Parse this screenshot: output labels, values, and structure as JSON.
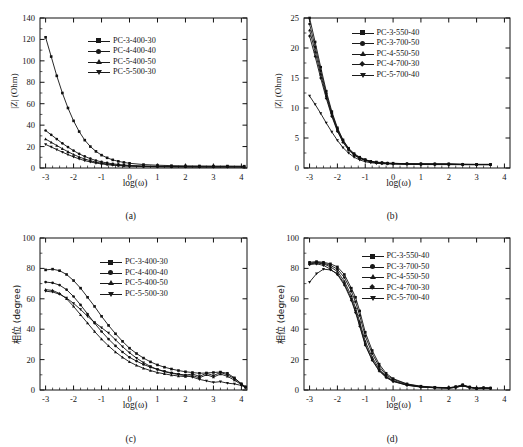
{
  "figure": {
    "panels": [
      {
        "id": "a",
        "caption": "(a)",
        "xlabel": "log(ω)",
        "ylabel": "|Z| (Ohm)"
      },
      {
        "id": "b",
        "caption": "(b)",
        "xlabel": "log(ω)",
        "ylabel": "|Z| (Ohm)"
      },
      {
        "id": "c",
        "caption": "(c)",
        "xlabel": "log(ω)",
        "ylabel": "相位 (degree)"
      },
      {
        "id": "d",
        "caption": "(d)",
        "xlabel": "log(ω)",
        "ylabel": "相位 (degree)"
      }
    ]
  },
  "chart_data": [
    {
      "type": "line",
      "panel": "a",
      "title": "",
      "xlabel": "log(ω)",
      "ylabel": "|Z| (Ohm)",
      "xlim": [
        -3.2,
        4.2
      ],
      "ylim": [
        0,
        140
      ],
      "xticks": [
        -3,
        -2,
        -1,
        0,
        1,
        2,
        3,
        4
      ],
      "yticks": [
        0,
        20,
        40,
        60,
        80,
        100,
        120,
        140
      ],
      "grid": false,
      "legend_position": "upper-center",
      "x": [
        -3.0,
        -2.8,
        -2.6,
        -2.4,
        -2.2,
        -2.0,
        -1.8,
        -1.6,
        -1.4,
        -1.2,
        -1.0,
        -0.8,
        -0.6,
        -0.4,
        -0.2,
        0.0,
        0.5,
        1.0,
        1.5,
        2.0,
        2.5,
        3.0,
        3.5,
        4.1
      ],
      "series": [
        {
          "name": "PC-3-400-30",
          "marker": "square",
          "values": [
            122.0,
            104.0,
            86.0,
            70.0,
            56.0,
            44.0,
            34.0,
            26.0,
            20.0,
            15.5,
            12.0,
            9.5,
            7.6,
            6.2,
            5.2,
            4.4,
            3.2,
            2.6,
            2.2,
            2.0,
            1.9,
            1.8,
            1.8,
            1.7
          ]
        },
        {
          "name": "PC-4-400-40",
          "marker": "circle",
          "values": [
            35.0,
            31.0,
            27.0,
            23.0,
            19.5,
            16.2,
            13.2,
            10.8,
            8.7,
            7.0,
            5.7,
            4.7,
            3.9,
            3.3,
            2.8,
            2.4,
            1.9,
            1.6,
            1.4,
            1.3,
            1.2,
            1.2,
            1.2,
            1.1
          ]
        },
        {
          "name": "PC-5-400-50",
          "marker": "triangle",
          "values": [
            27.0,
            24.0,
            21.0,
            18.0,
            15.2,
            12.6,
            10.3,
            8.4,
            6.8,
            5.5,
            4.5,
            3.7,
            3.1,
            2.6,
            2.2,
            1.9,
            1.5,
            1.3,
            1.2,
            1.1,
            1.1,
            1.0,
            1.0,
            1.0
          ]
        },
        {
          "name": "PC-5-500-30",
          "marker": "dtriangle",
          "values": [
            22.0,
            19.6,
            17.2,
            14.8,
            12.5,
            10.4,
            8.5,
            6.9,
            5.6,
            4.6,
            3.8,
            3.1,
            2.6,
            2.2,
            1.9,
            1.7,
            1.3,
            1.1,
            1.0,
            1.0,
            0.9,
            0.9,
            0.9,
            0.9
          ]
        }
      ]
    },
    {
      "type": "line",
      "panel": "b",
      "title": "",
      "xlabel": "log(ω)",
      "ylabel": "|Z| (Ohm)",
      "xlim": [
        -3.2,
        4.2
      ],
      "ylim": [
        0,
        25
      ],
      "xticks": [
        -3,
        -2,
        -1,
        0,
        1,
        2,
        3,
        4
      ],
      "yticks": [
        0,
        5,
        10,
        15,
        20,
        25
      ],
      "grid": false,
      "legend_position": "upper-center",
      "x": [
        -3.0,
        -2.8,
        -2.6,
        -2.4,
        -2.2,
        -2.0,
        -1.8,
        -1.6,
        -1.4,
        -1.2,
        -1.0,
        -0.8,
        -0.6,
        -0.4,
        -0.2,
        0.0,
        0.5,
        1.0,
        1.5,
        2.0,
        2.5,
        3.0,
        3.5
      ],
      "series": [
        {
          "name": "PC-3-550-40",
          "marker": "square",
          "values": [
            25.0,
            21.0,
            16.8,
            12.8,
            9.4,
            6.7,
            4.7,
            3.3,
            2.4,
            1.8,
            1.4,
            1.1,
            1.0,
            0.9,
            0.8,
            0.8,
            0.7,
            0.7,
            0.7,
            0.7,
            0.6,
            0.6,
            0.6
          ]
        },
        {
          "name": "PC-3-700-50",
          "marker": "circle",
          "values": [
            24.0,
            20.2,
            16.2,
            12.4,
            9.1,
            6.5,
            4.6,
            3.2,
            2.3,
            1.7,
            1.35,
            1.1,
            0.95,
            0.85,
            0.8,
            0.75,
            0.7,
            0.68,
            0.66,
            0.65,
            0.62,
            0.6,
            0.6
          ]
        },
        {
          "name": "PC-4-550-50",
          "marker": "triangle",
          "values": [
            23.0,
            19.4,
            15.6,
            12.0,
            8.8,
            6.3,
            4.4,
            3.1,
            2.2,
            1.65,
            1.3,
            1.05,
            0.9,
            0.82,
            0.77,
            0.73,
            0.68,
            0.65,
            0.63,
            0.62,
            0.6,
            0.58,
            0.58
          ]
        },
        {
          "name": "PC-4-700-30",
          "marker": "diamond",
          "values": [
            22.0,
            18.6,
            15.0,
            11.6,
            8.6,
            6.1,
            4.3,
            3.0,
            2.15,
            1.6,
            1.27,
            1.03,
            0.88,
            0.8,
            0.75,
            0.72,
            0.66,
            0.63,
            0.61,
            0.6,
            0.58,
            0.57,
            0.56
          ]
        },
        {
          "name": "PC-5-700-40",
          "marker": "dtriangle",
          "values": [
            12.0,
            10.6,
            9.1,
            7.5,
            6.0,
            4.6,
            3.4,
            2.5,
            1.8,
            1.35,
            1.05,
            0.88,
            0.78,
            0.72,
            0.68,
            0.65,
            0.6,
            0.58,
            0.57,
            0.56,
            0.55,
            0.54,
            0.54
          ]
        }
      ]
    },
    {
      "type": "line",
      "panel": "c",
      "title": "",
      "xlabel": "log(ω)",
      "ylabel": "相位 (degree)",
      "xlim": [
        -3.2,
        4.2
      ],
      "ylim": [
        0,
        100
      ],
      "xticks": [
        -3,
        -2,
        -1,
        0,
        1,
        2,
        3,
        4
      ],
      "yticks": [
        0,
        20,
        40,
        60,
        80,
        100
      ],
      "grid": false,
      "legend_position": "upper-center",
      "x": [
        -3.0,
        -2.75,
        -2.5,
        -2.25,
        -2.0,
        -1.75,
        -1.5,
        -1.25,
        -1.0,
        -0.75,
        -0.5,
        -0.25,
        0.0,
        0.25,
        0.5,
        0.75,
        1.0,
        1.25,
        1.5,
        1.75,
        2.0,
        2.25,
        2.5,
        2.75,
        3.0,
        3.25,
        3.5,
        3.75,
        4.0,
        4.15
      ],
      "series": [
        {
          "name": "PC-3-400-30",
          "marker": "square",
          "values": [
            79.0,
            79.5,
            78.5,
            76.0,
            72.0,
            67.0,
            61.0,
            55.0,
            48.5,
            42.5,
            37.0,
            32.0,
            27.5,
            24.0,
            21.0,
            18.5,
            16.5,
            15.0,
            13.8,
            12.8,
            12.0,
            11.5,
            11.0,
            11.2,
            11.5,
            11.8,
            11.0,
            8.0,
            4.0,
            2.0
          ]
        },
        {
          "name": "PC-4-400-40",
          "marker": "circle",
          "values": [
            71.0,
            70.5,
            69.0,
            66.0,
            61.5,
            56.0,
            50.0,
            44.0,
            38.5,
            33.5,
            29.0,
            25.0,
            21.5,
            19.0,
            16.8,
            15.0,
            13.5,
            12.3,
            11.3,
            10.5,
            9.8,
            10.5,
            9.0,
            11.0,
            9.5,
            11.5,
            10.0,
            7.5,
            4.0,
            2.0
          ]
        },
        {
          "name": "PC-5-400-50",
          "marker": "triangle",
          "values": [
            66.0,
            65.5,
            63.5,
            60.0,
            55.0,
            49.5,
            44.0,
            38.5,
            33.5,
            29.0,
            25.0,
            21.5,
            18.5,
            16.2,
            14.3,
            12.8,
            11.5,
            10.6,
            9.8,
            9.2,
            8.8,
            9.5,
            8.0,
            10.0,
            8.5,
            10.5,
            9.0,
            6.5,
            3.5,
            1.8
          ]
        },
        {
          "name": "PC-5-500-30",
          "marker": "dtriangle",
          "values": [
            65.0,
            64.5,
            63.0,
            60.5,
            57.0,
            53.0,
            48.5,
            44.5,
            41.0,
            37.5,
            33.0,
            28.5,
            24.5,
            21.0,
            18.0,
            15.5,
            13.5,
            12.0,
            11.0,
            10.2,
            9.5,
            8.5,
            7.0,
            6.0,
            5.0,
            5.5,
            4.5,
            4.0,
            3.0,
            1.5
          ]
        }
      ]
    },
    {
      "type": "line",
      "panel": "d",
      "title": "",
      "xlabel": "log(ω)",
      "ylabel": "相位 (degree)",
      "xlim": [
        -3.2,
        4.2
      ],
      "ylim": [
        0,
        100
      ],
      "xticks": [
        -3,
        -2,
        -1,
        0,
        1,
        2,
        3,
        4
      ],
      "yticks": [
        0,
        20,
        40,
        60,
        80,
        100
      ],
      "grid": false,
      "legend_position": "upper-center",
      "x": [
        -3.0,
        -2.75,
        -2.5,
        -2.25,
        -2.0,
        -1.75,
        -1.5,
        -1.35,
        -1.2,
        -1.0,
        -0.75,
        -0.5,
        -0.25,
        0.0,
        0.5,
        1.0,
        1.5,
        2.0,
        2.25,
        2.5,
        2.75,
        3.0,
        3.25,
        3.5
      ],
      "series": [
        {
          "name": "PC-3-550-40",
          "marker": "square",
          "values": [
            84.0,
            84.5,
            84.0,
            83.0,
            81.0,
            76.0,
            67.0,
            61.0,
            52.0,
            38.0,
            26.0,
            17.0,
            11.0,
            7.5,
            4.0,
            2.5,
            1.8,
            1.5,
            2.2,
            3.5,
            2.0,
            1.2,
            1.5,
            1.3
          ]
        },
        {
          "name": "PC-3-700-50",
          "marker": "circle",
          "values": [
            83.5,
            84.0,
            83.5,
            82.0,
            79.5,
            74.0,
            65.0,
            58.0,
            49.0,
            35.5,
            24.0,
            15.5,
            10.0,
            7.0,
            3.8,
            2.3,
            1.7,
            1.4,
            2.0,
            3.2,
            1.9,
            1.1,
            1.4,
            1.2
          ]
        },
        {
          "name": "PC-4-550-50",
          "marker": "triangle",
          "values": [
            83.0,
            83.5,
            83.0,
            81.0,
            78.0,
            71.5,
            62.0,
            54.0,
            45.0,
            32.0,
            21.5,
            14.0,
            9.0,
            6.2,
            3.4,
            2.1,
            1.6,
            1.3,
            1.8,
            2.9,
            1.7,
            1.0,
            1.3,
            1.1
          ]
        },
        {
          "name": "PC-4-700-30",
          "marker": "diamond",
          "values": [
            82.5,
            83.0,
            82.0,
            79.5,
            76.0,
            69.0,
            59.0,
            51.0,
            42.0,
            29.5,
            19.5,
            12.5,
            8.2,
            5.6,
            3.1,
            1.9,
            1.5,
            1.2,
            1.7,
            2.7,
            1.6,
            1.0,
            1.2,
            1.1
          ]
        },
        {
          "name": "PC-5-700-40",
          "marker": "dtriangle",
          "values": [
            71.0,
            76.5,
            79.5,
            79.0,
            76.5,
            70.0,
            60.0,
            52.0,
            43.0,
            30.0,
            20.0,
            13.0,
            8.5,
            5.8,
            3.2,
            2.0,
            1.5,
            1.25,
            1.75,
            2.8,
            1.65,
            1.0,
            1.25,
            1.1
          ]
        }
      ]
    }
  ]
}
